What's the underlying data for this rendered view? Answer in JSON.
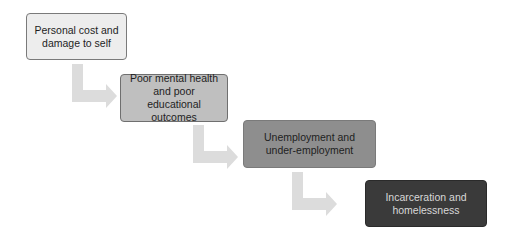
{
  "diagram": {
    "type": "cascading-flow",
    "direction": "top-left-to-bottom-right",
    "steps": [
      {
        "label": "Personal cost and damage to self",
        "lines": [
          "Personal cost and",
          "damage to self"
        ],
        "fill": "#ededed",
        "text_color": "#1e1e1e"
      },
      {
        "label": "Poor mental health and poor educational outcomes",
        "lines": [
          "Poor mental health",
          "and poor educational",
          "outcomes"
        ],
        "fill": "#bfbfbf",
        "text_color": "#1e1e1e"
      },
      {
        "label": "Unemployment and under-employment",
        "lines": [
          "Unemployment and",
          "under-employment"
        ],
        "fill": "#8e8e8e",
        "text_color": "#1e1e1e"
      },
      {
        "label": "Incarceration and homelessness",
        "lines": [
          "Incarceration and",
          "homelessness"
        ],
        "fill": "#3a3a3a",
        "text_color": "#d8d8d8"
      }
    ],
    "connectors": [
      {
        "from": 0,
        "to": 1,
        "shape": "elbow-arrow",
        "color": "#dcdcdc"
      },
      {
        "from": 1,
        "to": 2,
        "shape": "elbow-arrow",
        "color": "#dcdcdc"
      },
      {
        "from": 2,
        "to": 3,
        "shape": "elbow-arrow",
        "color": "#dcdcdc"
      }
    ]
  }
}
